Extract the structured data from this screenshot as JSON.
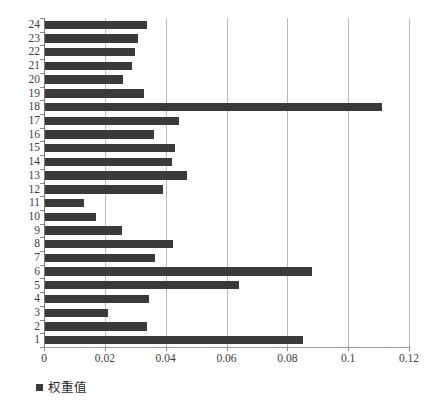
{
  "chart_data": {
    "type": "bar",
    "orientation": "horizontal",
    "title": "",
    "xlabel": "",
    "ylabel": "",
    "xlim": [
      0,
      0.12
    ],
    "ylim": [
      0.5,
      24.5
    ],
    "grid": true,
    "legend_position": "bottom-left",
    "xticks": [
      "0",
      "0.02",
      "0.04",
      "0.06",
      "0.08",
      "0.1",
      "0.12"
    ],
    "xtick_values": [
      0,
      0.02,
      0.04,
      0.06,
      0.08,
      0.1,
      0.12
    ],
    "categories": [
      "1",
      "2",
      "3",
      "4",
      "5",
      "6",
      "7",
      "8",
      "9",
      "10",
      "11",
      "12",
      "13",
      "14",
      "15",
      "16",
      "17",
      "18",
      "19",
      "20",
      "21",
      "22",
      "23",
      "24"
    ],
    "series": [
      {
        "name": "权重值",
        "color": "#3a3a3a",
        "values": [
          0.085,
          0.034,
          0.021,
          0.0345,
          0.064,
          0.088,
          0.0365,
          0.0425,
          0.0255,
          0.017,
          0.013,
          0.039,
          0.047,
          0.042,
          0.043,
          0.036,
          0.0445,
          0.111,
          0.033,
          0.026,
          0.029,
          0.03,
          0.031,
          0.034
        ]
      }
    ]
  },
  "legend": {
    "marker": "square-marker",
    "label": "权重值"
  }
}
